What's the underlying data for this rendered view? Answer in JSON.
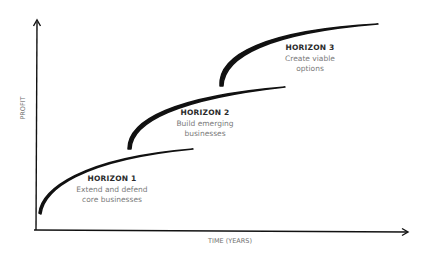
{
  "diagram": {
    "type": "three-horizons",
    "axes": {
      "y_label": "PROFIT",
      "x_label": "TIME (YEARS)"
    },
    "horizons": [
      {
        "title": "HORIZON 1",
        "line1": "Extend and defend",
        "line2": "core businesses"
      },
      {
        "title": "HORIZON 2",
        "line1": "Build emerging",
        "line2": "businesses"
      },
      {
        "title": "HORIZON 3",
        "line1": "Create viable",
        "line2": "options"
      }
    ],
    "colors": {
      "line": "#111111",
      "title": "#2a2a2a",
      "subtitle": "#7a7a7a",
      "background": "#ffffff"
    }
  }
}
